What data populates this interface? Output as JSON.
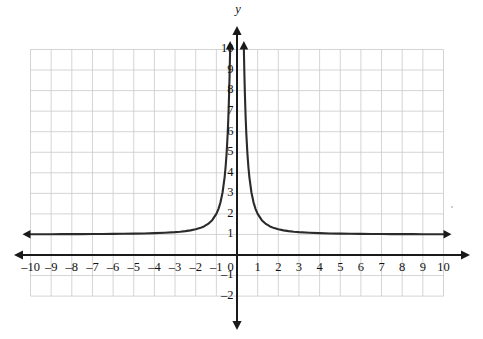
{
  "chart_data": {
    "type": "line",
    "title": "",
    "subtitle": "",
    "xlabel": "",
    "ylabel": "y",
    "axis_label_y": "y",
    "equation": "y = 1/x^2 + 1",
    "xlim": [
      -10,
      10
    ],
    "ylim": [
      -2,
      10
    ],
    "grid": true,
    "grid_xlim": [
      -10,
      10
    ],
    "grid_ylim": [
      -2,
      10
    ],
    "legend": "none",
    "x_tick_labels": [
      "–10",
      "–9",
      "–8",
      "–7",
      "–6",
      "–5",
      "–4",
      "–3",
      "–2",
      "–1",
      "0",
      "1",
      "2",
      "3",
      "4",
      "5",
      "6",
      "7",
      "8",
      "9",
      "10"
    ],
    "x_tick_values": [
      -10,
      -9,
      -8,
      -7,
      -6,
      -5,
      -4,
      -3,
      -2,
      -1,
      0,
      1,
      2,
      3,
      4,
      5,
      6,
      7,
      8,
      9,
      10
    ],
    "y_tick_labels": [
      "10",
      "9",
      "8",
      "7",
      "6",
      "5",
      "4",
      "3",
      "2",
      "1",
      "0",
      "–1",
      "–2"
    ],
    "y_tick_values": [
      10,
      9,
      8,
      7,
      6,
      5,
      4,
      3,
      2,
      1,
      0,
      -1,
      -2
    ],
    "horizontal_asymptote": 1,
    "vertical_asymptote": 0,
    "series": [
      {
        "name": "left branch",
        "arrow_start": "left",
        "arrow_end": "up",
        "x": [
          -10,
          -9.5,
          -9,
          -8.5,
          -8,
          -7.5,
          -7,
          -6.5,
          -6,
          -5.5,
          -5,
          -4.5,
          -4,
          -3.5,
          -3,
          -2.75,
          -2.5,
          -2.25,
          -2,
          -1.8,
          -1.6,
          -1.4,
          -1.2,
          -1,
          -0.9,
          -0.8,
          -0.7,
          -0.6,
          -0.55,
          -0.5,
          -0.45,
          -0.42,
          -0.4,
          -0.38,
          -0.36,
          -0.34,
          -0.333
        ],
        "y": [
          1.01,
          1.011,
          1.012,
          1.014,
          1.016,
          1.018,
          1.02,
          1.024,
          1.028,
          1.033,
          1.04,
          1.049,
          1.063,
          1.082,
          1.111,
          1.132,
          1.16,
          1.198,
          1.25,
          1.309,
          1.391,
          1.51,
          1.694,
          2,
          2.235,
          2.563,
          3.041,
          3.778,
          4.306,
          5,
          5.938,
          6.669,
          7.25,
          7.925,
          8.716,
          9.651,
          10
        ]
      },
      {
        "name": "right branch",
        "arrow_start": "right",
        "arrow_end": "up",
        "x": [
          10,
          9.5,
          9,
          8.5,
          8,
          7.5,
          7,
          6.5,
          6,
          5.5,
          5,
          4.5,
          4,
          3.5,
          3,
          2.75,
          2.5,
          2.25,
          2,
          1.8,
          1.6,
          1.4,
          1.2,
          1,
          0.9,
          0.8,
          0.7,
          0.6,
          0.55,
          0.5,
          0.45,
          0.42,
          0.4,
          0.38,
          0.36,
          0.34,
          0.333
        ],
        "y": [
          1.01,
          1.011,
          1.012,
          1.014,
          1.016,
          1.018,
          1.02,
          1.024,
          1.028,
          1.033,
          1.04,
          1.049,
          1.063,
          1.082,
          1.111,
          1.132,
          1.16,
          1.198,
          1.25,
          1.309,
          1.391,
          1.51,
          1.694,
          2,
          2.235,
          2.563,
          3.041,
          3.778,
          4.306,
          5,
          5.938,
          6.669,
          7.25,
          7.925,
          8.716,
          9.651,
          10
        ]
      }
    ]
  },
  "axes": {
    "x_axis_arrows": [
      "left",
      "right"
    ],
    "y_axis_arrows": [
      "up",
      "down"
    ]
  }
}
